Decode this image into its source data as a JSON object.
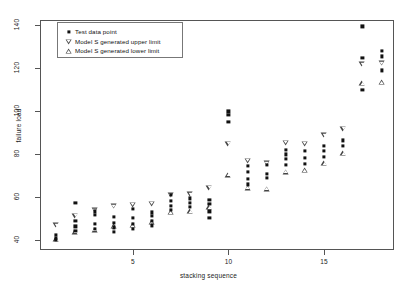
{
  "chart_data": {
    "type": "scatter",
    "title": "",
    "xlabel": "stacking sequence",
    "ylabel": "failure load",
    "xlim": [
      0.2,
      18.6
    ],
    "ylim": [
      36,
      142
    ],
    "xticks": [
      5,
      10,
      15
    ],
    "xtick_labels": [
      "5",
      "10",
      "15"
    ],
    "yticks": [
      40,
      60,
      80,
      100,
      120,
      140
    ],
    "ytick_labels": [
      "40",
      "60",
      "80",
      "100",
      "120",
      "140"
    ],
    "grid": false,
    "legend_position": "top-left",
    "legend": [
      {
        "label": "Test data point",
        "marker": "filled-square"
      },
      {
        "label": "Model S generated upper limit",
        "marker": "down-triangle"
      },
      {
        "label": "Model S generated lower limit",
        "marker": "up-triangle"
      }
    ],
    "series": [
      {
        "name": "Model S generated upper limit",
        "marker": "down-triangle",
        "x": [
          1,
          2,
          3,
          4,
          5,
          6,
          7,
          8,
          9,
          10,
          11,
          12,
          13,
          14,
          15,
          16,
          17,
          18
        ],
        "values": [
          47.0,
          51.5,
          54.0,
          56.0,
          56.5,
          57.0,
          61.0,
          61.5,
          64.5,
          85.0,
          77.0,
          76.0,
          85.5,
          85.0,
          89.0,
          92.0,
          122.0,
          122.5
        ]
      },
      {
        "name": "Model S generated lower limit",
        "marker": "up-triangle",
        "x": [
          1,
          2,
          3,
          4,
          5,
          6,
          7,
          8,
          9,
          10,
          11,
          12,
          13,
          14,
          15,
          16,
          17,
          18
        ],
        "values": [
          40.5,
          44.0,
          45.0,
          46.5,
          47.0,
          48.5,
          53.0,
          53.5,
          55.5,
          70.5,
          64.5,
          64.0,
          72.0,
          72.5,
          76.0,
          80.5,
          113.0,
          113.5
        ]
      },
      {
        "name": "Test data point",
        "marker": "filled-square",
        "points": [
          {
            "x": 1,
            "y": 41.0
          },
          {
            "x": 1,
            "y": 42.5
          },
          {
            "x": 1,
            "y": 40.3
          },
          {
            "x": 2,
            "y": 44.5
          },
          {
            "x": 2,
            "y": 46.5
          },
          {
            "x": 2,
            "y": 49.0
          },
          {
            "x": 2,
            "y": 57.5
          },
          {
            "x": 3,
            "y": 45.5
          },
          {
            "x": 3,
            "y": 47.5
          },
          {
            "x": 3,
            "y": 52.0
          },
          {
            "x": 3,
            "y": 53.5
          },
          {
            "x": 4,
            "y": 44.0
          },
          {
            "x": 4,
            "y": 46.0
          },
          {
            "x": 4,
            "y": 48.0
          },
          {
            "x": 4,
            "y": 51.0
          },
          {
            "x": 5,
            "y": 45.5
          },
          {
            "x": 5,
            "y": 47.5
          },
          {
            "x": 5,
            "y": 50.5
          },
          {
            "x": 5,
            "y": 54.5
          },
          {
            "x": 6,
            "y": 47.0
          },
          {
            "x": 6,
            "y": 49.0
          },
          {
            "x": 6,
            "y": 51.5
          },
          {
            "x": 6,
            "y": 53.0
          },
          {
            "x": 7,
            "y": 54.0
          },
          {
            "x": 7,
            "y": 56.0
          },
          {
            "x": 7,
            "y": 58.5
          },
          {
            "x": 7,
            "y": 61.0
          },
          {
            "x": 8,
            "y": 55.5
          },
          {
            "x": 8,
            "y": 57.5
          },
          {
            "x": 8,
            "y": 59.5
          },
          {
            "x": 9,
            "y": 57.0
          },
          {
            "x": 9,
            "y": 59.0
          },
          {
            "x": 9,
            "y": 50.5
          },
          {
            "x": 9,
            "y": 53.5
          },
          {
            "x": 10,
            "y": 95.0
          },
          {
            "x": 10,
            "y": 98.5
          },
          {
            "x": 10,
            "y": 100.0
          },
          {
            "x": 11,
            "y": 66.0
          },
          {
            "x": 11,
            "y": 68.5
          },
          {
            "x": 11,
            "y": 72.0
          },
          {
            "x": 11,
            "y": 74.5
          },
          {
            "x": 12,
            "y": 69.0
          },
          {
            "x": 12,
            "y": 71.0
          },
          {
            "x": 12,
            "y": 75.0
          },
          {
            "x": 13,
            "y": 75.0
          },
          {
            "x": 13,
            "y": 78.0
          },
          {
            "x": 13,
            "y": 80.0
          },
          {
            "x": 13,
            "y": 82.0
          },
          {
            "x": 14,
            "y": 75.5
          },
          {
            "x": 14,
            "y": 78.5
          },
          {
            "x": 14,
            "y": 81.5
          },
          {
            "x": 15,
            "y": 79.0
          },
          {
            "x": 15,
            "y": 81.5
          },
          {
            "x": 15,
            "y": 84.0
          },
          {
            "x": 16,
            "y": 84.0
          },
          {
            "x": 16,
            "y": 86.5
          },
          {
            "x": 17,
            "y": 125.0
          },
          {
            "x": 17,
            "y": 139.5
          },
          {
            "x": 17,
            "y": 110.0
          },
          {
            "x": 18,
            "y": 125.5
          },
          {
            "x": 18,
            "y": 128.0
          },
          {
            "x": 18,
            "y": 119.0
          }
        ]
      }
    ]
  }
}
